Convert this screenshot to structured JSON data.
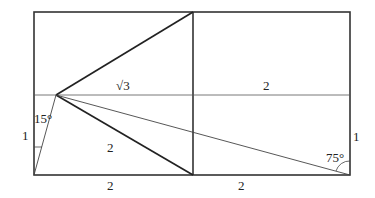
{
  "colors": {
    "background": "#ffffff",
    "stroke": "#333333",
    "text": "#222222"
  },
  "points": {
    "top_left": [
      34,
      12
    ],
    "top_mid": [
      193,
      12
    ],
    "top_right": [
      350,
      12
    ],
    "bottom_left": [
      34,
      175
    ],
    "bottom_mid": [
      193,
      175
    ],
    "bottom_right": [
      350,
      175
    ],
    "left_mid": [
      34,
      95
    ],
    "right_mid": [
      350,
      95
    ],
    "apex": [
      56,
      95
    ]
  },
  "labels": {
    "sqrt3": "√3",
    "top_right_segment": "2",
    "left_side": "1",
    "right_side": "1",
    "bottom_left": "2",
    "bottom_right": "2",
    "inner_segment": "2",
    "angle_left": "15°",
    "angle_right": "75°"
  }
}
